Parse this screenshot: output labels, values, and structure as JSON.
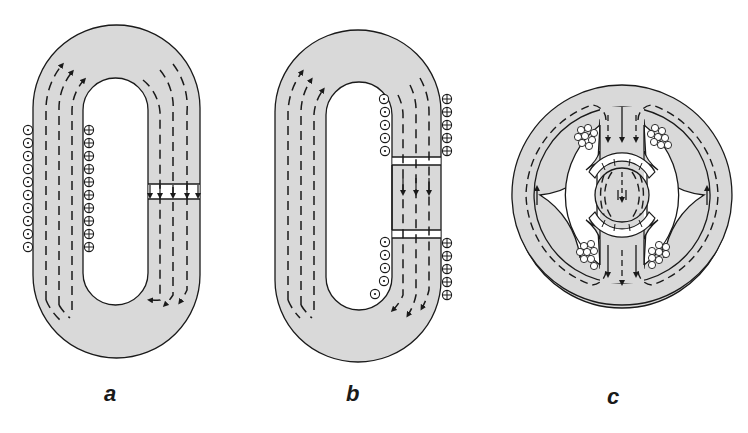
{
  "figure": {
    "colors": {
      "core_fill": "#d9d9d9",
      "stroke": "#1a1a1a",
      "background": "#ffffff"
    },
    "panels": [
      {
        "id": "a",
        "label": "a",
        "description": "Magnetic core loop with single air gap and coils on left limb"
      },
      {
        "id": "b",
        "label": "b",
        "description": "Magnetic core loop with inserted section, two air gaps and split coils on right limb"
      },
      {
        "id": "c",
        "label": "c",
        "description": "Circular stator with central rotor and four coil groups"
      }
    ],
    "symbols": {
      "coil_out": "dot-in-circle (current out of page)",
      "coil_in": "cross-in-circle (current into page)",
      "flux": "dashed flux lines with arrows"
    }
  }
}
